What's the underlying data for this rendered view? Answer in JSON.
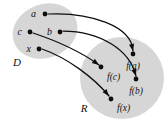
{
  "figure": {
    "background_color": "#ffffff",
    "ink_color": "#0d0d0d",
    "region_fill_color": "#d6d6d6"
  },
  "regions": [
    {
      "id": "domain",
      "label": "D",
      "fill": "#d6d6d6",
      "cx": 45,
      "cy": 31,
      "rx": 33,
      "ry": 27,
      "rotation": -20,
      "label_x": 17,
      "label_y": 66
    },
    {
      "id": "range",
      "label": "R",
      "fill": "#d6d6d6",
      "cx": 122,
      "cy": 78,
      "rx": 42,
      "ry": 41,
      "rotation": 0,
      "label_x": 84,
      "label_y": 112
    }
  ],
  "nodes": [
    {
      "id": "a",
      "label": "a",
      "set": "domain",
      "dot_x": 45,
      "dot_y": 14,
      "label_x": 36,
      "label_y": 12,
      "anchor": "end"
    },
    {
      "id": "c",
      "label": "c",
      "set": "domain",
      "dot_x": 30,
      "dot_y": 32,
      "label_x": 22,
      "label_y": 30,
      "anchor": "end"
    },
    {
      "id": "b",
      "label": "b",
      "set": "domain",
      "dot_x": 60,
      "dot_y": 32,
      "label_x": 52,
      "label_y": 30,
      "anchor": "end"
    },
    {
      "id": "x",
      "label": "x",
      "set": "domain",
      "dot_x": 39,
      "dot_y": 49,
      "label_x": 31,
      "label_y": 47,
      "anchor": "end"
    },
    {
      "id": "fa",
      "label": "f(a)",
      "set": "range",
      "dot_x": 133,
      "dot_y": 54,
      "label_x": 133,
      "label_y": 69,
      "anchor": "middle"
    },
    {
      "id": "fc",
      "label": "f(c)",
      "set": "range",
      "dot_x": 101,
      "dot_y": 67,
      "label_x": 107,
      "label_y": 80,
      "anchor": "start"
    },
    {
      "id": "fb",
      "label": "f(b)",
      "set": "range",
      "dot_x": 136,
      "dot_y": 79,
      "label_x": 136,
      "label_y": 94,
      "anchor": "middle"
    },
    {
      "id": "fx",
      "label": "f(x)",
      "set": "range",
      "dot_x": 111,
      "dot_y": 99,
      "label_x": 117,
      "label_y": 111,
      "anchor": "start"
    }
  ],
  "arrows": [
    {
      "id": "a-to-fa",
      "from": "a",
      "to": "fa",
      "path": "M 48 14 C 90 12, 132 26, 133 51"
    },
    {
      "id": "b-to-fb",
      "from": "b",
      "to": "fb",
      "path": "M 63 31 C 100 31, 130 50, 136 76"
    },
    {
      "id": "c-to-fc",
      "from": "c",
      "to": "fc",
      "path": "M 33 33 C 60 42, 84 54, 99 65"
    },
    {
      "id": "x-to-fx",
      "from": "x",
      "to": "fx",
      "path": "M 42 49 C 68 58, 94 78, 109 96"
    }
  ],
  "arrowheads": [
    {
      "id": "head-fa",
      "x": 133,
      "y": 51,
      "angle": 78
    },
    {
      "id": "head-fb",
      "x": 136,
      "y": 76,
      "angle": 72
    },
    {
      "id": "head-fc",
      "x": 99,
      "y": 65,
      "angle": 36
    },
    {
      "id": "head-fx",
      "x": 109,
      "y": 96,
      "angle": 50
    }
  ]
}
